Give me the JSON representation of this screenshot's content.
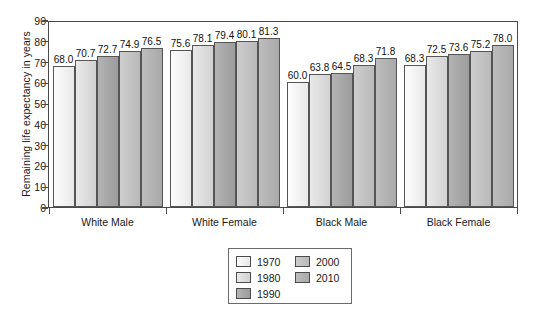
{
  "chart_data": {
    "type": "bar",
    "title": "",
    "xlabel": "",
    "ylabel": "Remaining life expectancy in years",
    "ylim": [
      0,
      90
    ],
    "yticks": [
      0,
      10,
      20,
      30,
      40,
      50,
      60,
      70,
      80,
      90
    ],
    "grid": false,
    "legend_position": "bottom-center",
    "categories": [
      "White Male",
      "White Female",
      "Black Male",
      "Black Female"
    ],
    "series": [
      {
        "name": "1970",
        "color": "#f2f2f2",
        "values": [
          68.0,
          75.6,
          60.0,
          68.3
        ]
      },
      {
        "name": "1980",
        "color": "#dcdcdc",
        "values": [
          70.7,
          78.1,
          63.8,
          72.5
        ]
      },
      {
        "name": "1990",
        "color": "#a6a6a6",
        "values": [
          72.7,
          79.4,
          64.5,
          73.6
        ]
      },
      {
        "name": "2000",
        "color": "#c2c2c2",
        "values": [
          74.9,
          80.1,
          68.3,
          75.2
        ]
      },
      {
        "name": "2010",
        "color": "#b2b2b2",
        "values": [
          76.5,
          81.3,
          71.8,
          78.0
        ]
      }
    ],
    "data_labels": [
      [
        "68.0",
        "70.7",
        "72.7",
        "74.9",
        "76.5"
      ],
      [
        "75.6",
        "78.1",
        "79.4",
        "80.1",
        "81.3"
      ],
      [
        "60.0",
        "63.8",
        "64.5",
        "68.3",
        "71.8"
      ],
      [
        "68.3",
        "72.5",
        "73.6",
        "75.2",
        "78.0"
      ]
    ]
  }
}
